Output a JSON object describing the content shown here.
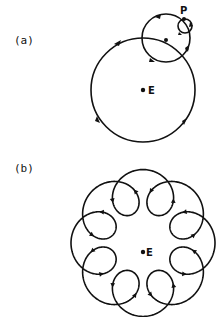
{
  "figure": {
    "panel_a": {
      "label": "(a)",
      "center_label": "E",
      "point_label": "P",
      "deferent": {
        "cx": 143,
        "cy": 90,
        "r": 52
      },
      "epicycle": {
        "cx": 166,
        "cy": 38,
        "r": 24
      },
      "sub_epicycle": {
        "cx": 185,
        "cy": 26,
        "r": 7
      },
      "direction": "counterclockwise"
    },
    "panel_b": {
      "label": "(b)",
      "center_label": "E",
      "loops": 8,
      "center": {
        "x": 143,
        "y": 243
      },
      "deferent_radius": 51,
      "epicycle_radius": 21,
      "direction": "counterclockwise"
    },
    "stroke_color": "#111111"
  }
}
